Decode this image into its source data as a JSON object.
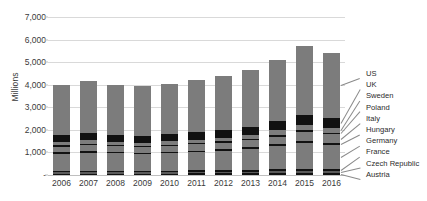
{
  "chart_data": {
    "type": "bar",
    "subtype": "stacked-bar",
    "title": "",
    "xlabel": "",
    "ylabel": "Millions",
    "ylim": [
      0,
      7000
    ],
    "ytick_values": [
      0,
      1000,
      2000,
      3000,
      4000,
      5000,
      6000,
      7000
    ],
    "ytick_labels": [
      "-",
      "1,000",
      "2,000",
      "3,000",
      "4,000",
      "5,000",
      "6,000",
      "7,000"
    ],
    "grid": true,
    "legend_position": "right",
    "categories": [
      "2006",
      "2007",
      "2008",
      "2009",
      "2010",
      "2011",
      "2012",
      "2013",
      "2014",
      "2015",
      "2016"
    ],
    "series": [
      {
        "name": "Austria",
        "color": "#111111",
        "values": [
          60,
          65,
          62,
          60,
          63,
          68,
          72,
          78,
          85,
          92,
          88
        ]
      },
      {
        "name": "Czech Republic",
        "color": "#5a5a5a",
        "values": [
          55,
          58,
          56,
          54,
          57,
          61,
          66,
          71,
          78,
          85,
          82
        ]
      },
      {
        "name": "France",
        "color": "#111111",
        "values": [
          70,
          74,
          71,
          69,
          72,
          77,
          83,
          90,
          99,
          108,
          104
        ]
      },
      {
        "name": "Germany",
        "color": "#7c7c7c",
        "values": [
          760,
          800,
          770,
          745,
          775,
          810,
          845,
          905,
          1010,
          1130,
          1070
        ]
      },
      {
        "name": "Hungary",
        "color": "#111111",
        "values": [
          60,
          64,
          61,
          59,
          62,
          66,
          71,
          77,
          85,
          95,
          90
        ]
      },
      {
        "name": "Italy",
        "color": "#7c7c7c",
        "values": [
          260,
          270,
          262,
          255,
          264,
          276,
          290,
          310,
          345,
          385,
          365
        ]
      },
      {
        "name": "Poland",
        "color": "#111111",
        "values": [
          55,
          58,
          56,
          54,
          57,
          60,
          64,
          69,
          77,
          86,
          82
        ]
      },
      {
        "name": "Sweden",
        "color": "#7c7c7c",
        "values": [
          140,
          150,
          144,
          140,
          146,
          154,
          163,
          176,
          197,
          222,
          210
        ]
      },
      {
        "name": "UK",
        "color": "#111111",
        "values": [
          300,
          320,
          305,
          295,
          308,
          325,
          345,
          372,
          420,
          480,
          450
        ]
      },
      {
        "name": "US",
        "color": "#7c7c7c",
        "values": [
          2240,
          2291,
          2213,
          2199,
          2226,
          2303,
          2401,
          2502,
          2684,
          3037,
          2879
        ]
      }
    ],
    "totals": [
      4000,
      4150,
      4000,
      3930,
      4030,
      4150,
      4300,
      4550,
      5080,
      5720,
      5420
    ]
  },
  "legend": {
    "entries": [
      {
        "label": "US"
      },
      {
        "label": "UK"
      },
      {
        "label": "Sweden"
      },
      {
        "label": "Poland"
      },
      {
        "label": "Italy"
      },
      {
        "label": "Hungary"
      },
      {
        "label": "Germany"
      },
      {
        "label": "France"
      },
      {
        "label": "Czech Republic"
      },
      {
        "label": "Austria"
      }
    ]
  },
  "colors": {
    "series_gray": "#7c7c7c",
    "series_dark": "#111111",
    "gridline": "#d9d9d9",
    "text": "#3a3a3a",
    "background": "#ffffff"
  }
}
